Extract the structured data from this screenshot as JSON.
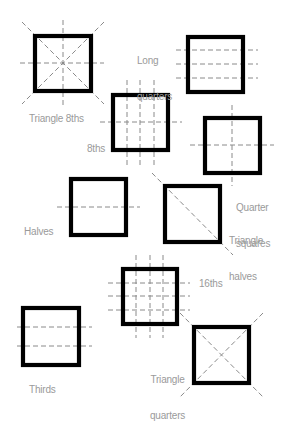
{
  "colors": {
    "square": "#000000",
    "guide": "#8a8a8a",
    "label": "#9a9a9a",
    "background": "#ffffff"
  },
  "cuts": [
    {
      "id": "triangle-8ths",
      "label": "Triangle 8ths",
      "square": [
        35,
        36,
        56,
        55
      ]
    },
    {
      "id": "long-quarters",
      "label_line1": "Long",
      "label_line2": "quarters",
      "square": [
        188,
        37,
        55,
        55
      ]
    },
    {
      "id": "8ths",
      "label": "8ths",
      "square": [
        113,
        95,
        55,
        55
      ]
    },
    {
      "id": "quarter-squares",
      "label_line1": "Quarter",
      "label_line2": "squares",
      "square": [
        205,
        118,
        55,
        55
      ]
    },
    {
      "id": "halves",
      "label": "Halves",
      "square": [
        71,
        179,
        55,
        56
      ]
    },
    {
      "id": "triangle-halves",
      "label_line1": "Triangle",
      "label_line2": "halves",
      "square": [
        165,
        186,
        55,
        56
      ]
    },
    {
      "id": "16ths",
      "label": "16ths",
      "square": [
        123,
        269,
        54,
        55
      ]
    },
    {
      "id": "thirds",
      "label": "Thirds",
      "square": [
        23,
        308,
        56,
        57
      ]
    },
    {
      "id": "triangle-quarters",
      "label_line1": "Triangle",
      "label_line2": "quarters",
      "square": [
        194,
        327,
        55,
        56
      ]
    }
  ]
}
